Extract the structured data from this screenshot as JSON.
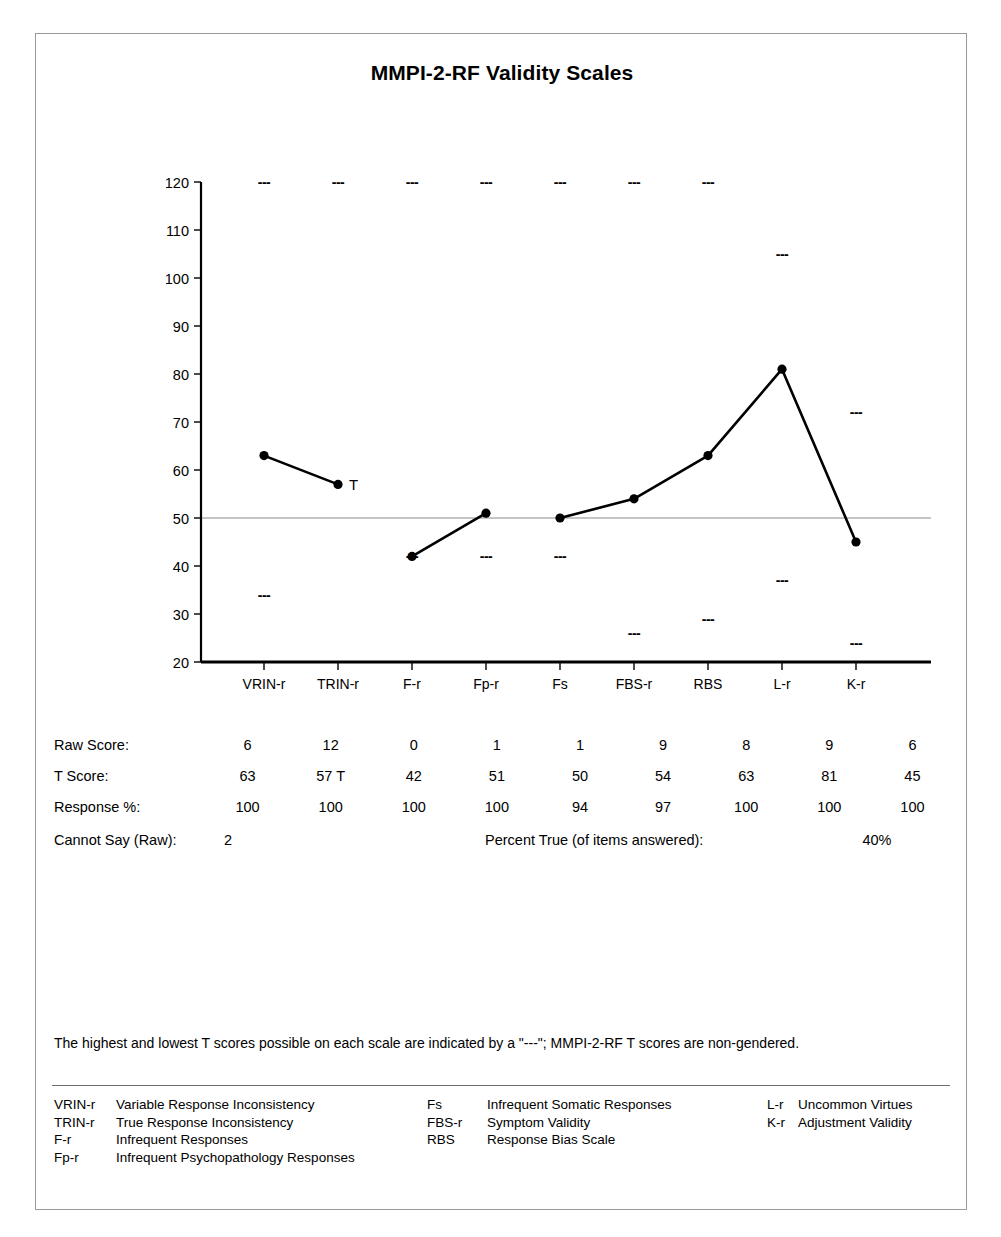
{
  "report": {
    "title": "MMPI-2-RF Validity Scales"
  },
  "chart_data": {
    "type": "line",
    "title": "MMPI-2-RF Validity Scales",
    "xlabel": "",
    "ylabel": "",
    "ylim": [
      20,
      120
    ],
    "yticks": [
      20,
      30,
      40,
      50,
      60,
      70,
      80,
      90,
      100,
      110,
      120
    ],
    "grid": false,
    "reference_line": 50,
    "categories": [
      "VRIN-r",
      "TRIN-r",
      "F-r",
      "Fp-r",
      "Fs",
      "FBS-r",
      "RBS",
      "L-r",
      "K-r"
    ],
    "series": [
      {
        "name": "T Score",
        "values": [
          63,
          57,
          42,
          51,
          50,
          54,
          63,
          81,
          45
        ],
        "segments": [
          [
            0,
            1
          ],
          [
            2,
            3
          ],
          [
            4,
            5,
            6,
            7,
            8
          ]
        ]
      }
    ],
    "annotations": [
      {
        "text": "T",
        "category": "TRIN-r",
        "value": 57
      }
    ],
    "max_markers": {
      "label": "---",
      "values": [
        120,
        120,
        120,
        120,
        120,
        120,
        120,
        105,
        72
      ]
    },
    "min_markers": {
      "label": "---",
      "values": [
        34,
        null,
        42,
        42,
        42,
        26,
        29,
        37,
        24
      ]
    },
    "legend_position": "none"
  },
  "table": {
    "rows": [
      {
        "label": "Raw Score:",
        "values": [
          "6",
          "12",
          "0",
          "1",
          "1",
          "9",
          "8",
          "9",
          "6"
        ]
      },
      {
        "label": "T Score:",
        "values": [
          "63",
          "57 T",
          "42",
          "51",
          "50",
          "54",
          "63",
          "81",
          "45"
        ]
      },
      {
        "label": "Response %:",
        "values": [
          "100",
          "100",
          "100",
          "100",
          "94",
          "97",
          "100",
          "100",
          "100"
        ]
      }
    ]
  },
  "summary": {
    "cannot_say_label": "Cannot Say (Raw):",
    "cannot_say_value": "2",
    "percent_true_label": "Percent True (of items answered):",
    "percent_true_value": "40%"
  },
  "footnote": {
    "text": "The highest and lowest T scores possible on each scale are indicated by a \"---\"; MMPI-2-RF T scores are non-gendered."
  },
  "legend": {
    "column1": [
      {
        "abbr": "VRIN-r",
        "desc": "Variable Response Inconsistency"
      },
      {
        "abbr": "TRIN-r",
        "desc": "True Response Inconsistency"
      },
      {
        "abbr": "F-r",
        "desc": "Infrequent Responses"
      },
      {
        "abbr": "Fp-r",
        "desc": "Infrequent Psychopathology Responses"
      }
    ],
    "column2": [
      {
        "abbr": "Fs",
        "desc": "Infrequent Somatic Responses"
      },
      {
        "abbr": "FBS-r",
        "desc": "Symptom Validity"
      },
      {
        "abbr": "RBS",
        "desc": "Response Bias Scale"
      }
    ],
    "column3": [
      {
        "abbr": "L-r",
        "desc": "Uncommon Virtues"
      },
      {
        "abbr": "K-r",
        "desc": "Adjustment Validity"
      }
    ]
  },
  "colors": {
    "line": "#000000",
    "axis": "#000000",
    "reference_line": "#8a8a8a",
    "frame": "#9a9a9a",
    "text": "#000000"
  }
}
